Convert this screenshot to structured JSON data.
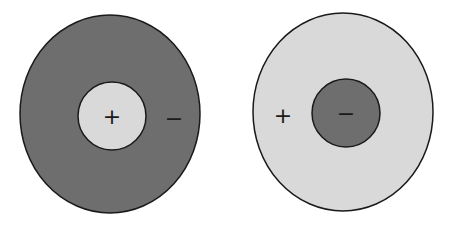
{
  "diagram": {
    "type": "charge-distribution",
    "colors": {
      "dark": "#6e6e6e",
      "light": "#d9d9d9",
      "stroke": "#1a1a1a",
      "background": "#ffffff"
    },
    "left": {
      "outer": {
        "fill": "dark",
        "sign": "−"
      },
      "inner": {
        "fill": "light",
        "sign": "+"
      }
    },
    "right": {
      "outer": {
        "fill": "light",
        "sign": "+"
      },
      "inner": {
        "fill": "dark",
        "sign": "−"
      }
    }
  }
}
